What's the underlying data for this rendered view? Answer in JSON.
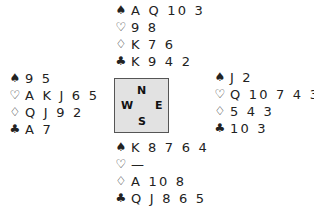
{
  "deal": {
    "north": {
      "spades": "AQ103",
      "hearts": "98",
      "diamonds": "K76",
      "clubs": "K942",
      "spades_display": "A Q 10 3",
      "hearts_display": "9 8",
      "diamonds_display": "K 7 6",
      "clubs_display": "K 9 4 2"
    },
    "west": {
      "spades_display": "9 5",
      "hearts_display": "A K J 6 5",
      "diamonds_display": "Q J 9 2",
      "clubs_display": "A 7"
    },
    "east": {
      "spades_display": "J 2",
      "hearts_display": "Q 10 7 4 3 2",
      "diamonds_display": "5 4 3",
      "clubs_display": "10 3"
    },
    "south": {
      "spades_display": "K 8 7 6 4",
      "hearts_display": "—",
      "diamonds_display": "A 10 8",
      "clubs_display": "Q J 8 6 5"
    }
  },
  "suits": {
    "spades": "♠",
    "hearts": "♡",
    "diamonds": "♢",
    "clubs": "♣"
  },
  "compass": {
    "north": "N",
    "west": "W",
    "east": "E",
    "south": "S"
  },
  "colors": {
    "text": "#222222",
    "compass_bg": "#e2e2e2",
    "compass_border": "#555555"
  }
}
